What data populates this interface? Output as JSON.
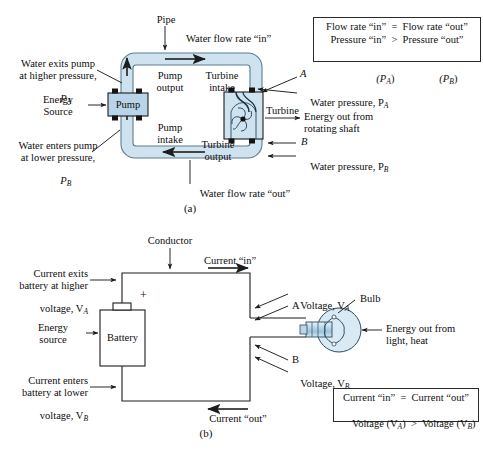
{
  "figure": {
    "panel_a_caption": "(a)",
    "panel_b_caption": "(b)"
  },
  "colors": {
    "pipe_fill": "#cfe2ef",
    "pipe_stroke": "#4a6a80",
    "device_fill": "#b9d4e8",
    "device_stroke": "#1c1c1c",
    "bulb_fill": "#d9eaf4",
    "wire": "#1c1c1c",
    "text": "#0d0d0d",
    "box_border": "#2a2a2a"
  },
  "panel_a": {
    "caption": "(a)",
    "labels": {
      "pipe": "Pipe",
      "flow_in": "Water flow rate “in”",
      "flow_out": "Water flow rate “out”",
      "water_exits_1": "Water exits pump",
      "water_exits_2": "at higher pressure,",
      "water_exits_3": "P",
      "water_exits_3_sub": "A",
      "water_enters_1": "Water enters pump",
      "water_enters_2": "at lower pressure,",
      "water_enters_3": "P",
      "water_enters_3_sub": "B",
      "energy_source_1": "Energy",
      "energy_source_2": "Source",
      "pump": "Pump",
      "pump_output_1": "Pump",
      "pump_output_2": "output",
      "pump_intake_1": "Pump",
      "pump_intake_2": "intake",
      "turbine_intake_1": "Turbine",
      "turbine_intake_2": "intake",
      "turbine_output_1": "Turbine",
      "turbine_output_2": "output",
      "turbine": "Turbine",
      "point_a": "A",
      "point_b": "B",
      "water_pressure_a": "Water pressure, P",
      "water_pressure_a_sub": "A",
      "water_pressure_b": "Water pressure, P",
      "water_pressure_b_sub": "B",
      "energy_out_1": "Energy out from",
      "energy_out_2": "rotating shaft"
    },
    "info_box": {
      "line1": "Flow rate “in”  =  Flow rate “out”",
      "line2": "Pressure “in”  >  Pressure “out”",
      "line3_left": "(P",
      "line3_left_sub": "A",
      "line3_left_end": ")",
      "line3_right": "(P",
      "line3_right_sub": "B",
      "line3_right_end": ")"
    }
  },
  "panel_b": {
    "caption": "(b)",
    "labels": {
      "conductor": "Conductor",
      "current_in": "Current “in”",
      "current_out": "Current “out”",
      "current_exits_1": "Current exits",
      "current_exits_2": "battery at higher",
      "current_exits_3": "voltage, V",
      "current_exits_3_sub": "A",
      "current_enters_1": "Current enters",
      "current_enters_2": "battery at lower",
      "current_enters_3": "voltage, V",
      "current_enters_3_sub": "B",
      "energy_source_1": "Energy",
      "energy_source_2": "source",
      "battery": "Battery",
      "plus": "+",
      "voltage_a": "Voltage, V",
      "voltage_a_sub": "A",
      "voltage_b": "Voltage, V",
      "voltage_b_sub": "B",
      "point_a": "A",
      "point_b": "B",
      "bulb": "Bulb",
      "energy_out_1": "Energy out from",
      "energy_out_2": "light, heat"
    },
    "info_box": {
      "line1": "Current “in”  =  Current “out”",
      "line2_a": "Voltage (V",
      "line2_a_sub": "A",
      "line2_mid": ")  >  Voltage (V",
      "line2_b_sub": "B",
      "line2_end": ")"
    }
  }
}
